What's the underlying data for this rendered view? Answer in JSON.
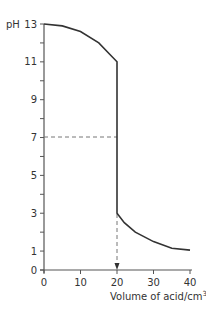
{
  "chart_data": {
    "type": "line",
    "title": "",
    "xlabel": "Volume of acid/cm",
    "xlabel_superscript": "3",
    "ylabel": "pH",
    "xlim": [
      0,
      40
    ],
    "ylim": [
      0,
      13
    ],
    "x_ticks": [
      0,
      10,
      20,
      30,
      40
    ],
    "y_tick_labels": [
      0,
      1,
      3,
      5,
      7,
      9,
      11,
      13
    ],
    "y_minor_ticks": [
      2,
      4,
      6,
      8,
      10,
      12
    ],
    "grid": false,
    "series": [
      {
        "name": "titration curve",
        "points": [
          {
            "x": 0,
            "y": 13.0
          },
          {
            "x": 5,
            "y": 12.9
          },
          {
            "x": 10,
            "y": 12.6
          },
          {
            "x": 15,
            "y": 12.0
          },
          {
            "x": 18,
            "y": 11.4
          },
          {
            "x": 20,
            "y": 11.0
          },
          {
            "x": 20,
            "y": 3.0
          },
          {
            "x": 22,
            "y": 2.5
          },
          {
            "x": 25,
            "y": 2.0
          },
          {
            "x": 30,
            "y": 1.5
          },
          {
            "x": 35,
            "y": 1.15
          },
          {
            "x": 40,
            "y": 1.05
          }
        ]
      }
    ],
    "annotations": [
      {
        "type": "dashed-horizontal",
        "y": 7,
        "x_from": 0,
        "x_to": 20
      },
      {
        "type": "dashed-vertical-arrow",
        "x": 20,
        "y_from": 3,
        "y_to": 0
      }
    ]
  }
}
